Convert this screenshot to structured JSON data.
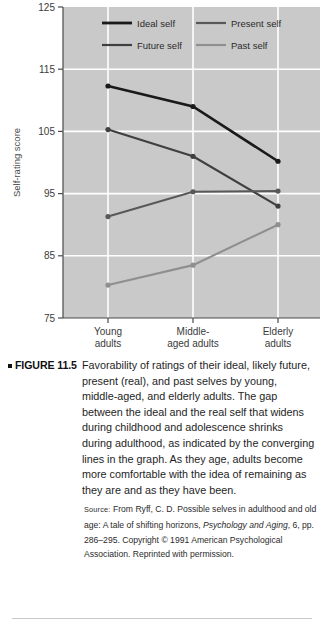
{
  "chart_data": {
    "type": "line",
    "title": "",
    "xlabel": "",
    "ylabel": "Self-rating score",
    "categories": [
      "Young adults",
      "Middle-aged adults",
      "Elderly adults"
    ],
    "category_lines": [
      [
        "Young",
        "adults"
      ],
      [
        "Middle-",
        "aged adults"
      ],
      [
        "Elderly",
        "adults"
      ]
    ],
    "ylim": [
      75,
      125
    ],
    "yticks": [
      125,
      115,
      105,
      95,
      85,
      75
    ],
    "grid": true,
    "legend_position": "top-inside",
    "plot_background": "#c9c9c9",
    "gridline_color": "#ffffff",
    "series": [
      {
        "name": "Ideal self",
        "color": "#1a1a1a",
        "values": [
          112.3,
          109.0,
          100.2
        ]
      },
      {
        "name": "Future self",
        "color": "#3f3f3f",
        "values": [
          105.3,
          101.0,
          93.0
        ]
      },
      {
        "name": "Present self",
        "color": "#585858",
        "values": [
          91.3,
          95.3,
          95.4
        ]
      },
      {
        "name": "Past self",
        "color": "#8f8f8f",
        "values": [
          80.3,
          83.5,
          90.0
        ]
      }
    ],
    "legend_order": [
      "Ideal self",
      "Present self",
      "Future self",
      "Past self"
    ]
  },
  "caption": {
    "figure_label": "FIGURE 11.5",
    "body": "Favorability of ratings of their ideal, likely future, present (real), and past selves by young, middle-aged, and elderly adults. The gap between the ideal and the real self that widens during childhood and adolescence shrinks during adulthood, as indicated by the converging lines in the graph. As they age, adults become more comfortable with the idea of remaining as they are and as they have been.",
    "source_prefix": "Source:",
    "source_part1": " From Ryff, C. D. Possible selves in adulthood and old age: A tale of shifting horizons, ",
    "source_journal": "Psychology and Aging",
    "source_part2": ", 6, pp. 286–295. Copyright © 1991 American Psychological Association. Reprinted with permission."
  }
}
